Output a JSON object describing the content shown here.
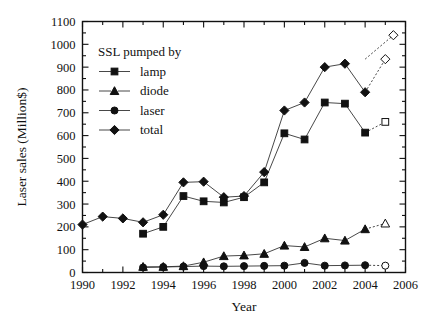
{
  "chart_data": {
    "type": "line",
    "title": "",
    "xlabel": "Year",
    "ylabel": "Laser sales (Million$)",
    "xlim": [
      1990,
      2006
    ],
    "ylim": [
      0,
      1100
    ],
    "ytick_step": 100,
    "xtick_step": 2,
    "xtick_minor_step": 1,
    "grid": false,
    "legend_position": "upper-left-inside",
    "legend_title": "SSL pumped by",
    "xticks": [
      "1990",
      "1992",
      "1994",
      "1996",
      "1998",
      "2000",
      "2002",
      "2004",
      "2006"
    ],
    "yticks": [
      "0",
      "100",
      "200",
      "300",
      "400",
      "500",
      "600",
      "700",
      "800",
      "900",
      "1000",
      "1100"
    ],
    "series": [
      {
        "name": "lamp",
        "marker": "square",
        "x": [
          1993,
          1994,
          1995,
          1996,
          1997,
          1998,
          1999,
          2000,
          2001,
          2002,
          2003,
          2004
        ],
        "values": [
          170,
          200,
          335,
          312,
          307,
          330,
          395,
          610,
          583,
          745,
          740,
          613
        ],
        "projected_x": [
          2004,
          2005
        ],
        "projected_values": [
          613,
          660
        ],
        "projected_open_marker": true
      },
      {
        "name": "diode",
        "marker": "triangle",
        "x": [
          1993,
          1994,
          1995,
          1996,
          1997,
          1998,
          1999,
          2000,
          2001,
          2002,
          2003,
          2004
        ],
        "values": [
          25,
          25,
          28,
          45,
          72,
          75,
          82,
          118,
          112,
          150,
          140,
          190
        ],
        "projected_x": [
          2004,
          2005
        ],
        "projected_values": [
          190,
          215
        ],
        "projected_open_marker": true
      },
      {
        "name": "laser",
        "marker": "circle",
        "x": [
          1993,
          1994,
          1995,
          1996,
          1997,
          1998,
          1999,
          2000,
          2001,
          2002,
          2003,
          2004
        ],
        "values": [
          22,
          24,
          26,
          28,
          27,
          28,
          29,
          30,
          42,
          30,
          31,
          32
        ],
        "projected_x": [
          2004,
          2005
        ],
        "projected_values": [
          32,
          30
        ],
        "projected_open_marker": true
      },
      {
        "name": "total",
        "marker": "diamond",
        "x": [
          1990,
          1991,
          1992,
          1993,
          1994,
          1995,
          1996,
          1997,
          1998,
          1999,
          2000,
          2001,
          2002,
          2003,
          2004
        ],
        "values": [
          210,
          245,
          237,
          220,
          253,
          395,
          398,
          330,
          335,
          440,
          710,
          745,
          900,
          915,
          790
        ],
        "projected_x": [
          2004,
          2005
        ],
        "projected_values": [
          790,
          935
        ],
        "projected_open_marker": true
      }
    ],
    "extra_points": [
      {
        "series": "total",
        "x": 2005,
        "value": 935,
        "marker": "diamond",
        "open": true
      },
      {
        "series": "lamp",
        "x": 2005,
        "value": 660,
        "marker": "square",
        "open": true
      },
      {
        "series": "diode",
        "x": 2005,
        "value": 215,
        "marker": "triangle",
        "open": true
      },
      {
        "series": "laser",
        "x": 2005,
        "value": 30,
        "marker": "circle",
        "open": true
      }
    ],
    "extra_tail": [
      {
        "series": "total",
        "x_from": 2004,
        "y_from": 935,
        "x_to": 2005.4,
        "y_to": 1040,
        "marker": "diamond",
        "open": true
      }
    ]
  },
  "legend": {
    "title": "SSL pumped by",
    "entries": [
      {
        "label": "lamp",
        "marker": "square"
      },
      {
        "label": "diode",
        "marker": "triangle"
      },
      {
        "label": "laser",
        "marker": "circle"
      },
      {
        "label": "total",
        "marker": "diamond"
      }
    ]
  },
  "colors": {
    "axis": "#111111",
    "line": "#333333",
    "marker_fill": "#111111",
    "marker_open_fill": "#ffffff",
    "background": "#ffffff"
  }
}
